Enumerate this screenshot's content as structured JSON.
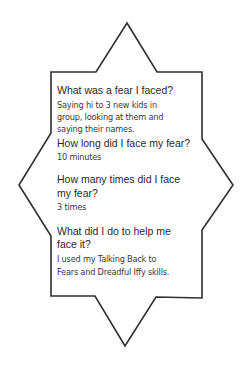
{
  "worksheet": {
    "shape": {
      "stroke_color": "#2f2f2f",
      "fill_color": "#ffffff"
    },
    "sections": [
      {
        "question_lines": [
          "What was a fear I faced?"
        ],
        "answer_lines": [
          "Saying hi to 3 new kids in",
          "group, looking at them and",
          "saying their names."
        ]
      },
      {
        "question_lines": [
          "How long did I face my fear?"
        ],
        "answer_lines": [
          "10 minutes"
        ]
      },
      {
        "question_lines": [
          "How many times did I face",
          "my fear?"
        ],
        "answer_lines": [
          "3 times"
        ]
      },
      {
        "question_lines": [
          "What did I do to help me",
          "face it?"
        ],
        "answer_lines": [
          "I used my Talking Back to",
          "Fears and Dreadful Iffy skills."
        ]
      }
    ]
  }
}
